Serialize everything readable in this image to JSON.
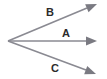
{
  "diagram": {
    "type": "geometry-rays",
    "background_color": "#ffffff",
    "line_color": "#8a8a92",
    "arrow_color": "#7a7a82",
    "label_color": "#2b2b2b",
    "canvas": {
      "width": 107,
      "height": 79
    },
    "vertex": {
      "x": 8,
      "y": 41
    },
    "rays": [
      {
        "id": "ray-b",
        "label": "B",
        "label_x": 50,
        "label_y": 16,
        "from_x": 8,
        "from_y": 41,
        "to_x": 97,
        "to_y": 4,
        "shaft_to_x": 87,
        "shaft_to_y": 8,
        "stroke_width": 1.6,
        "arrow_size": 11
      },
      {
        "id": "ray-a",
        "label": "A",
        "label_x": 66,
        "label_y": 37,
        "from_x": 8,
        "from_y": 41,
        "to_x": 97,
        "to_y": 41,
        "shaft_to_x": 86,
        "shaft_to_y": 41,
        "stroke_width": 1.3,
        "arrow_size": 11
      },
      {
        "id": "ray-c",
        "label": "C",
        "label_x": 55,
        "label_y": 72,
        "from_x": 8,
        "from_y": 41,
        "to_x": 96,
        "to_y": 74,
        "shaft_to_x": 86,
        "shaft_to_y": 70,
        "stroke_width": 1.6,
        "arrow_size": 11
      }
    ]
  }
}
